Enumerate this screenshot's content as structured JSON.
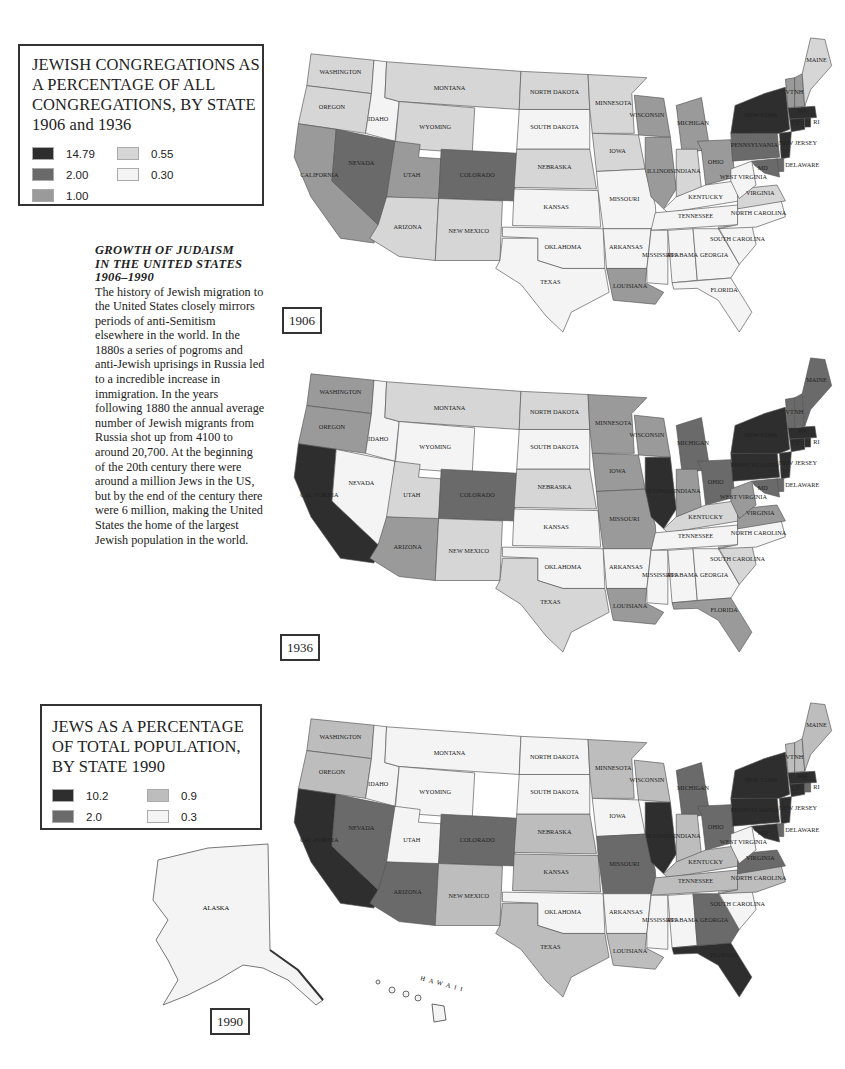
{
  "legend_1906_1936": {
    "title": "JEWISH CONGREGATIONS AS A PERCENTAGE OF ALL CONGREGATIONS, BY STATE 1906 and 1936",
    "items": [
      {
        "value": "14.79",
        "color": "#2e2e2e"
      },
      {
        "value": "0.55",
        "color": "#d6d6d6"
      },
      {
        "value": "2.00",
        "color": "#6a6a6a"
      },
      {
        "value": "0.30",
        "color": "#f4f4f4"
      },
      {
        "value": "1.00",
        "color": "#9a9a9a"
      }
    ]
  },
  "essay": {
    "heading_line1": "GROWTH OF JUDAISM",
    "heading_line2": "IN THE UNITED STATES",
    "heading_line3": "1906–1990",
    "body": "The history of Jewish migration to the United States closely mirrors periods of anti-Semitism elsewhere in the world. In the 1880s a series of pogroms and anti-Jewish uprisings in Russia led to a incredible increase in immigration. In the years following 1880 the annual average number of Jewish migrants from Russia shot up from 4100 to around 20,700. At the beginning of the 20th century there were around a million Jews in the US, but by the end of the century there were 6 million, making the United States the home of the largest Jewish population in the world."
  },
  "legend_1990": {
    "title": "JEWS AS A PERCENTAGE OF TOTAL POPULATION, BY STATE 1990",
    "items": [
      {
        "value": "10.2",
        "color": "#2e2e2e"
      },
      {
        "value": "0.9",
        "color": "#bdbdbd"
      },
      {
        "value": "2.0",
        "color": "#6a6a6a"
      },
      {
        "value": "0.3",
        "color": "#f4f4f4"
      }
    ]
  },
  "maps": {
    "m1906": {
      "year": "1906"
    },
    "m1936": {
      "year": "1936"
    },
    "m1990": {
      "year": "1990",
      "extra_labels": {
        "alaska": "ALASKA",
        "hawaii": "HAWAII",
        "dc": "DC"
      }
    }
  },
  "state_labels": {
    "WA": "WASHINGTON",
    "OR": "OREGON",
    "CA": "CALIFORNIA",
    "ID": "IDAHO",
    "NV": "NEVADA",
    "MT": "MONTANA",
    "WY": "WYOMING",
    "UT": "UTAH",
    "AZ": "ARIZONA",
    "CO": "COLORADO",
    "NM": "NEW MEXICO",
    "ND": "NORTH DAKOTA",
    "SD": "SOUTH DAKOTA",
    "NE": "NEBRASKA",
    "KS": "KANSAS",
    "OK": "OKLAHOMA",
    "TX": "TEXAS",
    "MN": "MINNESOTA",
    "IA": "IOWA",
    "MO": "MISSOURI",
    "AR": "ARKANSAS",
    "LA": "LOUISIANA",
    "WI": "WISCONSIN",
    "IL": "ILLINOIS",
    "MI": "MICHIGAN",
    "IN": "INDIANA",
    "OH": "OHIO",
    "KY": "KENTUCKY",
    "TN": "TENNESSEE",
    "MS": "MISSISSIPPI",
    "AL": "ALABAMA",
    "GA": "GEORGIA",
    "FL": "FLORIDA",
    "SC": "SOUTH CAROLINA",
    "NC": "NORTH CAROLINA",
    "VA": "VIRGINIA",
    "WV": "WEST VIRGINIA",
    "PA": "PENNSYLVANIA",
    "NY": "NEW YORK",
    "NJ": "NEW JERSEY",
    "DE": "DELAWARE",
    "MD": "MD",
    "CT": "CT",
    "RI": "RI",
    "MA": "MA",
    "VT": "VT",
    "NH": "NH",
    "ME": "MAINE"
  },
  "chart_data": [
    {
      "type": "choropleth",
      "title": "Jewish congregations as a percentage of all congregations, by state, 1906",
      "legend": [
        "14.79",
        "2.00",
        "1.00",
        "0.55",
        "0.30"
      ],
      "values": {
        "WA": "0.55",
        "OR": "0.55",
        "CA": "1.00",
        "ID": "0.30",
        "NV": "2.00",
        "MT": "0.55",
        "WY": "0.55",
        "UT": "1.00",
        "AZ": "0.55",
        "CO": "2.00",
        "NM": "0.55",
        "ND": "0.55",
        "SD": "0.30",
        "NE": "0.55",
        "KS": "0.30",
        "OK": "0.30",
        "TX": "0.30",
        "MN": "0.55",
        "IA": "0.55",
        "MO": "0.30",
        "AR": "0.30",
        "LA": "1.00",
        "WI": "1.00",
        "IL": "1.00",
        "MI": "1.00",
        "IN": "0.55",
        "OH": "1.00",
        "KY": "0.30",
        "TN": "0.30",
        "MS": "0.30",
        "AL": "0.30",
        "GA": "0.30",
        "FL": "0.30",
        "SC": "0.30",
        "NC": "0.30",
        "VA": "0.55",
        "WV": "0.30",
        "PA": "2.00",
        "NY": "14.79",
        "NJ": "14.79",
        "DE": "2.00",
        "MD": "2.00",
        "CT": "14.79",
        "RI": "14.79",
        "MA": "14.79",
        "VT": "1.00",
        "NH": "1.00",
        "ME": "0.55"
      }
    },
    {
      "type": "choropleth",
      "title": "Jewish congregations as a percentage of all congregations, by state, 1936",
      "legend": [
        "14.79",
        "2.00",
        "1.00",
        "0.55",
        "0.30"
      ],
      "values": {
        "WA": "1.00",
        "OR": "1.00",
        "CA": "14.79",
        "ID": "0.30",
        "NV": "0.30",
        "MT": "0.55",
        "WY": "0.30",
        "UT": "0.55",
        "AZ": "1.00",
        "CO": "2.00",
        "NM": "0.55",
        "ND": "0.55",
        "SD": "0.30",
        "NE": "0.55",
        "KS": "0.30",
        "OK": "0.30",
        "TX": "0.55",
        "MN": "1.00",
        "IA": "1.00",
        "MO": "1.00",
        "AR": "0.30",
        "LA": "1.00",
        "WI": "1.00",
        "IL": "14.79",
        "MI": "2.00",
        "IN": "1.00",
        "OH": "2.00",
        "KY": "0.55",
        "TN": "0.30",
        "MS": "0.30",
        "AL": "0.30",
        "GA": "0.30",
        "FL": "1.00",
        "SC": "0.55",
        "NC": "0.30",
        "VA": "1.00",
        "WV": "1.00",
        "PA": "14.79",
        "NY": "14.79",
        "NJ": "14.79",
        "DE": "2.00",
        "MD": "2.00",
        "CT": "14.79",
        "RI": "14.79",
        "MA": "14.79",
        "VT": "2.00",
        "NH": "2.00",
        "ME": "2.00"
      }
    },
    {
      "type": "choropleth",
      "title": "Jews as a percentage of total population, by state, 1990",
      "legend": [
        "10.2",
        "2.0",
        "0.9",
        "0.3"
      ],
      "values": {
        "WA": "0.9",
        "OR": "0.9",
        "CA": "10.2",
        "ID": "0.3",
        "NV": "2.0",
        "MT": "0.3",
        "WY": "0.3",
        "UT": "0.3",
        "AZ": "2.0",
        "CO": "2.0",
        "NM": "0.9",
        "ND": "0.3",
        "SD": "0.3",
        "NE": "0.9",
        "KS": "0.9",
        "OK": "0.3",
        "TX": "0.9",
        "MN": "0.9",
        "IA": "0.3",
        "MO": "2.0",
        "AR": "0.3",
        "LA": "0.9",
        "WI": "0.9",
        "IL": "10.2",
        "MI": "2.0",
        "IN": "0.9",
        "OH": "2.0",
        "KY": "0.9",
        "TN": "0.9",
        "MS": "0.3",
        "AL": "0.3",
        "GA": "2.0",
        "FL": "10.2",
        "SC": "0.3",
        "NC": "0.9",
        "VA": "2.0",
        "WV": "0.3",
        "PA": "10.2",
        "NY": "10.2",
        "NJ": "10.2",
        "DE": "2.0",
        "MD": "10.2",
        "CT": "10.2",
        "RI": "2.0",
        "MA": "10.2",
        "VT": "0.9",
        "NH": "0.9",
        "ME": "0.9",
        "AK": "0.3",
        "HI": "0.3"
      }
    }
  ]
}
